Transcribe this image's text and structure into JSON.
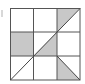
{
  "figure": {
    "grid": {
      "rows": 3,
      "cols": 3,
      "x0": 10,
      "y0": 8,
      "x1": 80,
      "y1": 80
    },
    "colors": {
      "line": "#555555",
      "shade": "#c8c8c8",
      "background": "#ffffff"
    },
    "shaded_regions": [
      {
        "cell": [
          0,
          2
        ],
        "shape": "triangle-upper-left"
      },
      {
        "cell": [
          1,
          0
        ],
        "shape": "full"
      },
      {
        "cell": [
          1,
          1
        ],
        "shape": "triangle-lower-right"
      },
      {
        "cell": [
          2,
          2
        ],
        "shape": "triangle-lower-left"
      }
    ],
    "diagonals": [
      {
        "from": "bottom-left-of-grid",
        "to": "top-right-of-grid"
      },
      {
        "from": "top-left-of-cell-2-2",
        "to": "bottom-right-of-cell-2-2"
      }
    ]
  }
}
